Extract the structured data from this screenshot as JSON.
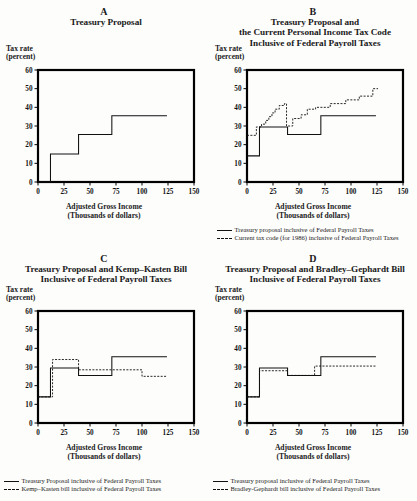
{
  "figure": {
    "axis": {
      "y_label_line1": "Tax rate",
      "y_label_line2": "(percent)",
      "x_label_line1": "Adjusted Gross Income",
      "x_label_line2": "(Thousands of dollars)",
      "y_ticks": [
        "60",
        "50",
        "40",
        "30",
        "20",
        "10",
        "0"
      ],
      "x_ticks": [
        "0",
        "25",
        "50",
        "75",
        "100",
        "125",
        "150"
      ],
      "ylim": [
        0,
        60
      ],
      "xlim": [
        0,
        150
      ]
    },
    "colors": {
      "line": "#111111",
      "frame": "#000000",
      "background": "#fdfdfc"
    }
  },
  "panels": [
    {
      "letter": "A",
      "title_lines": [
        "Treasury Proposal"
      ],
      "legend": []
    },
    {
      "letter": "B",
      "title_lines": [
        "Treasury Proposal and",
        "the Current Personal Income Tax Code",
        "Inclusive of Federal Payroll Taxes"
      ],
      "legend": [
        {
          "style": "solid",
          "label": "Treasury proposal inclusive of Federal Payroll Taxes"
        },
        {
          "style": "dashed",
          "label": "Current tax code (for 1986) inclusive of Federal Payroll Taxes"
        }
      ]
    },
    {
      "letter": "C",
      "title_lines": [
        "Treasury Proposal and Kemp–Kasten Bill",
        "Inclusive of Federal Payroll Taxes"
      ],
      "legend": [
        {
          "style": "solid",
          "label": "Treasury Proposal inclusive of Federal Payroll Taxes"
        },
        {
          "style": "dashed",
          "label": "Kemp–Kasten bill inclusive of Federal Payroll Taxes"
        }
      ]
    },
    {
      "letter": "D",
      "title_lines": [
        "Treasury Proposal and Bradley–Gephardt Bill",
        "Inclusive of Federal Payroll Taxes"
      ],
      "legend": [
        {
          "style": "solid",
          "label": "Treasury proposal inclusive of Federal Payroll Taxes"
        },
        {
          "style": "dashed",
          "label": "Bradley-Gephardt bill inclusive of Federal Payroll Taxes"
        }
      ]
    }
  ],
  "chart_data": [
    {
      "type": "line",
      "panel": "A",
      "title": "Treasury Proposal",
      "xlabel": "Adjusted Gross Income (Thousands of dollars)",
      "ylabel": "Tax rate (percent)",
      "xlim": [
        0,
        150
      ],
      "ylim": [
        0,
        60
      ],
      "grid": false,
      "legend_position": "none",
      "series": [
        {
          "name": "Treasury proposal",
          "style": "solid",
          "step_points": [
            [
              0,
              0
            ],
            [
              12,
              0
            ],
            [
              12,
              15
            ],
            [
              39,
              15
            ],
            [
              39,
              25.5
            ],
            [
              71,
              25.5
            ],
            [
              71,
              35.5
            ],
            [
              124,
              35.5
            ]
          ]
        }
      ]
    },
    {
      "type": "line",
      "panel": "B",
      "title": "Treasury Proposal and the Current Personal Income Tax Code Inclusive of Federal Payroll Taxes",
      "xlabel": "Adjusted Gross Income (Thousands of dollars)",
      "ylabel": "Tax rate (percent)",
      "xlim": [
        0,
        150
      ],
      "ylim": [
        0,
        60
      ],
      "grid": false,
      "legend_position": "below",
      "series": [
        {
          "name": "Treasury proposal inclusive of Federal Payroll Taxes",
          "style": "solid",
          "step_points": [
            [
              0,
              14
            ],
            [
              12,
              14
            ],
            [
              12,
              29.5
            ],
            [
              39,
              29.5
            ],
            [
              39,
              25.5
            ],
            [
              71,
              25.5
            ],
            [
              71,
              35.5
            ],
            [
              124,
              35.5
            ]
          ]
        },
        {
          "name": "Current tax code (for 1986) inclusive of Federal Payroll Taxes",
          "style": "dashed",
          "step_points": [
            [
              0,
              25
            ],
            [
              9,
              25
            ],
            [
              9,
              29.5
            ],
            [
              14,
              29.5
            ],
            [
              14,
              31
            ],
            [
              18,
              31
            ],
            [
              18,
              33
            ],
            [
              21,
              33
            ],
            [
              21,
              35
            ],
            [
              24,
              35
            ],
            [
              24,
              37
            ],
            [
              27,
              37
            ],
            [
              27,
              39
            ],
            [
              31,
              39
            ],
            [
              31,
              41
            ],
            [
              36,
              41
            ],
            [
              36,
              42
            ],
            [
              38,
              42
            ],
            [
              38,
              30
            ],
            [
              44,
              30
            ],
            [
              44,
              34
            ],
            [
              52,
              34
            ],
            [
              52,
              36
            ],
            [
              58,
              36
            ],
            [
              58,
              39
            ],
            [
              66,
              39
            ],
            [
              66,
              40
            ],
            [
              80,
              40
            ],
            [
              80,
              42
            ],
            [
              95,
              42
            ],
            [
              95,
              44
            ],
            [
              108,
              44
            ],
            [
              108,
              46
            ],
            [
              121,
              46
            ],
            [
              121,
              50
            ],
            [
              126,
              50
            ]
          ]
        }
      ]
    },
    {
      "type": "line",
      "panel": "C",
      "title": "Treasury Proposal and Kemp–Kasten Bill Inclusive of Federal Payroll Taxes",
      "xlabel": "Adjusted Gross Income (Thousands of dollars)",
      "ylabel": "Tax rate (percent)",
      "xlim": [
        0,
        150
      ],
      "ylim": [
        0,
        60
      ],
      "grid": false,
      "legend_position": "below",
      "series": [
        {
          "name": "Treasury Proposal inclusive of Federal Payroll Taxes",
          "style": "solid",
          "step_points": [
            [
              0,
              14
            ],
            [
              12,
              14
            ],
            [
              12,
              29.5
            ],
            [
              39,
              29.5
            ],
            [
              39,
              25.5
            ],
            [
              71,
              25.5
            ],
            [
              71,
              35.5
            ],
            [
              124,
              35.5
            ]
          ]
        },
        {
          "name": "Kemp–Kasten bill inclusive of Federal Payroll Taxes",
          "style": "dashed",
          "step_points": [
            [
              0,
              14
            ],
            [
              14,
              14
            ],
            [
              14,
              34
            ],
            [
              39,
              34
            ],
            [
              39,
              28.5
            ],
            [
              100,
              28.5
            ],
            [
              100,
              25
            ],
            [
              124,
              25
            ]
          ]
        }
      ]
    },
    {
      "type": "line",
      "panel": "D",
      "title": "Treasury Proposal and Bradley–Gephardt Bill Inclusive of Federal Payroll Taxes",
      "xlabel": "Adjusted Gross Income (Thousands of dollars)",
      "ylabel": "Tax rate (percent)",
      "xlim": [
        0,
        150
      ],
      "ylim": [
        0,
        60
      ],
      "grid": false,
      "legend_position": "below",
      "series": [
        {
          "name": "Treasury proposal inclusive of Federal Payroll Taxes",
          "style": "solid",
          "step_points": [
            [
              0,
              14
            ],
            [
              12,
              14
            ],
            [
              12,
              29.5
            ],
            [
              39,
              29.5
            ],
            [
              39,
              25.5
            ],
            [
              71,
              25.5
            ],
            [
              71,
              35.5
            ],
            [
              124,
              35.5
            ]
          ]
        },
        {
          "name": "Bradley-Gephardt bill inclusive of Federal Payroll Taxes",
          "style": "dashed",
          "step_points": [
            [
              0,
              14
            ],
            [
              12,
              14
            ],
            [
              12,
              28
            ],
            [
              39,
              28
            ],
            [
              39,
              25.5
            ],
            [
              65,
              25.5
            ],
            [
              65,
              30.5
            ],
            [
              124,
              30.5
            ]
          ]
        }
      ]
    }
  ]
}
